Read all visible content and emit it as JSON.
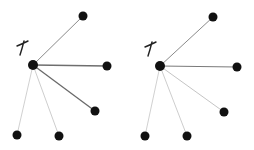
{
  "diagram": {
    "type": "star-graph-comparison",
    "graphs": [
      {
        "id": "left",
        "label": "x",
        "center": {
          "x": 33,
          "y": 65
        },
        "label_pos": {
          "x": 22,
          "y": 49
        },
        "leaves": [
          {
            "x": 83,
            "y": 16,
            "edge_color": "#8a8a8a",
            "edge_width": 1.0
          },
          {
            "x": 107,
            "y": 66,
            "edge_color": "#6e6e6e",
            "edge_width": 1.3
          },
          {
            "x": 95,
            "y": 111,
            "edge_color": "#6a6a6a",
            "edge_width": 1.3
          },
          {
            "x": 17,
            "y": 135,
            "edge_color": "#c4c4c4",
            "edge_width": 0.8
          },
          {
            "x": 59,
            "y": 136,
            "edge_color": "#c0c0c0",
            "edge_width": 0.8
          }
        ]
      },
      {
        "id": "right",
        "label": "x",
        "center": {
          "x": 160,
          "y": 66
        },
        "label_pos": {
          "x": 150,
          "y": 50
        },
        "leaves": [
          {
            "x": 213,
            "y": 17,
            "edge_color": "#8a8a8a",
            "edge_width": 1.0
          },
          {
            "x": 237,
            "y": 67,
            "edge_color": "#7a7a7a",
            "edge_width": 1.2
          },
          {
            "x": 224,
            "y": 112,
            "edge_color": "#bdbdbd",
            "edge_width": 0.9
          },
          {
            "x": 145,
            "y": 136,
            "edge_color": "#c4c4c4",
            "edge_width": 0.8
          },
          {
            "x": 187,
            "y": 136,
            "edge_color": "#c0c0c0",
            "edge_width": 0.8
          }
        ]
      }
    ],
    "node_color": "#111111",
    "node_radius": 4.5
  }
}
